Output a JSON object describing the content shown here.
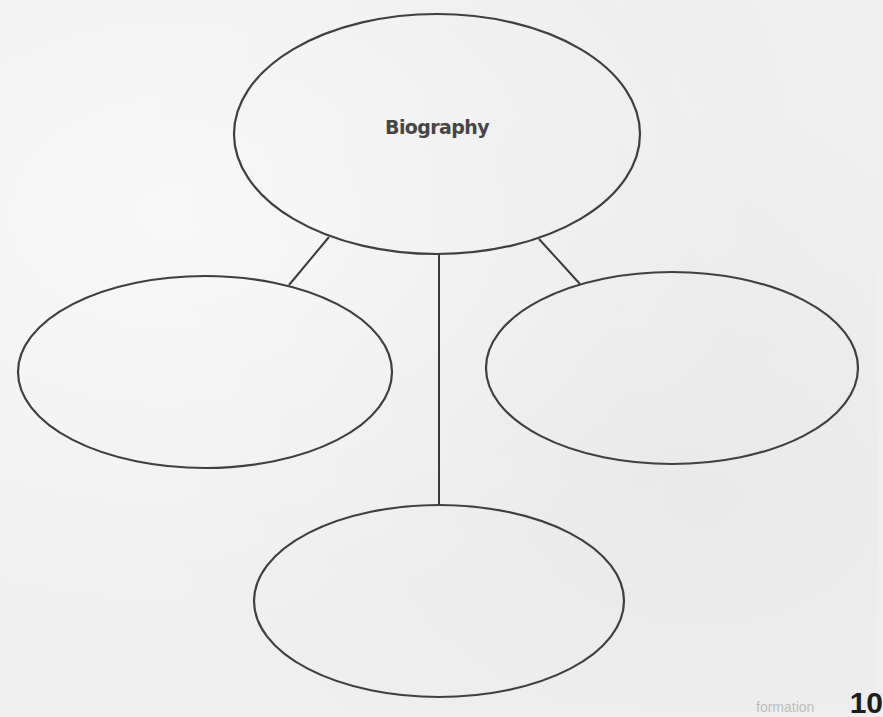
{
  "organizer": {
    "type": "web graphic organizer",
    "center": {
      "label": "Biography",
      "cx": 437,
      "cy": 134,
      "rx": 203,
      "ry": 120
    },
    "branches": [
      {
        "id": "left",
        "label": "",
        "cx": 205,
        "cy": 372,
        "rx": 187,
        "ry": 96
      },
      {
        "id": "right",
        "label": "",
        "cx": 672,
        "cy": 368,
        "rx": 186,
        "ry": 96
      },
      {
        "id": "bottom",
        "label": "",
        "cx": 439,
        "cy": 601,
        "rx": 185,
        "ry": 96
      }
    ],
    "connectors": [
      {
        "to": "left",
        "x1": 329,
        "y1": 237,
        "x2": 289,
        "y2": 285
      },
      {
        "to": "right",
        "x1": 539,
        "y1": 239,
        "x2": 580,
        "y2": 284
      },
      {
        "to": "bottom",
        "x1": 439,
        "y1": 254,
        "x2": 439,
        "y2": 505
      }
    ]
  },
  "footer": {
    "ghost_text": "formation",
    "page_number": "10"
  },
  "colors": {
    "stroke": "#3f3f3f",
    "background": "#f0f0f0",
    "label": "#454545"
  }
}
